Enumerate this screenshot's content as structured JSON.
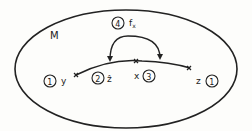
{
  "diagram": {
    "set_label": "M",
    "points": [
      {
        "id": "y",
        "label": "y",
        "tag": "1"
      },
      {
        "id": "z_hat",
        "label": "ẑ",
        "tag": "2"
      },
      {
        "id": "x",
        "label": "x",
        "tag": "3"
      },
      {
        "id": "z",
        "label": "z",
        "tag": "1"
      }
    ],
    "map": {
      "label": "f",
      "subscript": "x",
      "tag": "4"
    }
  }
}
